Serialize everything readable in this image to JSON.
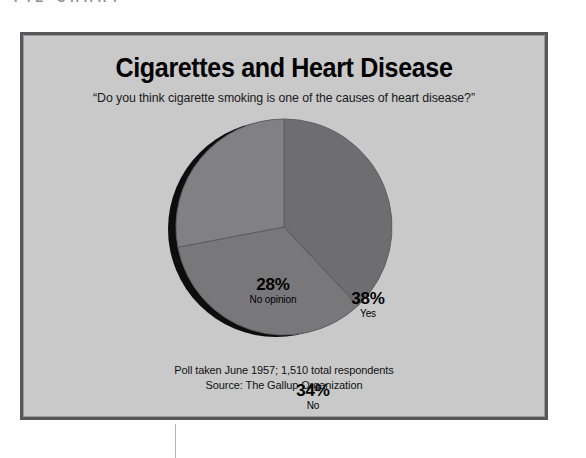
{
  "page": {
    "running_header": "PIE CHART"
  },
  "chart_panel": {
    "title": "Cigarettes and Heart Disease",
    "subtitle": "“Do you think cigarette smoking is one of the causes of heart disease?”",
    "footnote_line1": "Poll taken June 1957; 1,510 total respondents",
    "footnote_line2": "Source: The Gallup Organization",
    "frame_border_color": "#58585a",
    "panel_background": "#c9c9c9"
  },
  "chart_data": {
    "type": "pie",
    "title": "Cigarettes and Heart Disease",
    "subtitle": "“Do you think cigarette smoking is one of the causes of heart disease?”",
    "xlabel": "",
    "ylabel": "",
    "legend_position": "none",
    "grid": false,
    "labels_inside_slices": true,
    "start_angle_deg": 0,
    "direction": "clockwise",
    "has_drop_shadow": true,
    "shadow_color": "#0d0d0d",
    "categories": [
      "Yes",
      "No",
      "No opinion"
    ],
    "values": [
      38,
      34,
      28
    ],
    "value_labels": [
      "38%",
      "34%",
      "28%"
    ],
    "colors": [
      "#6e6e70",
      "#78787a",
      "#818183"
    ],
    "total_respondents": "1,510",
    "poll_date": "June 1957",
    "source": "The Gallup Organization",
    "slices": [
      {
        "name": "Yes",
        "value": 38,
        "label": "38%",
        "color": "#6e6e70",
        "start_deg": 0,
        "end_deg": 136.8
      },
      {
        "name": "No",
        "value": 34,
        "label": "34%",
        "color": "#78787a",
        "start_deg": 136.8,
        "end_deg": 259.2
      },
      {
        "name": "No opinion",
        "value": 28,
        "label": "28%",
        "color": "#818183",
        "start_deg": 259.2,
        "end_deg": 360
      }
    ]
  }
}
